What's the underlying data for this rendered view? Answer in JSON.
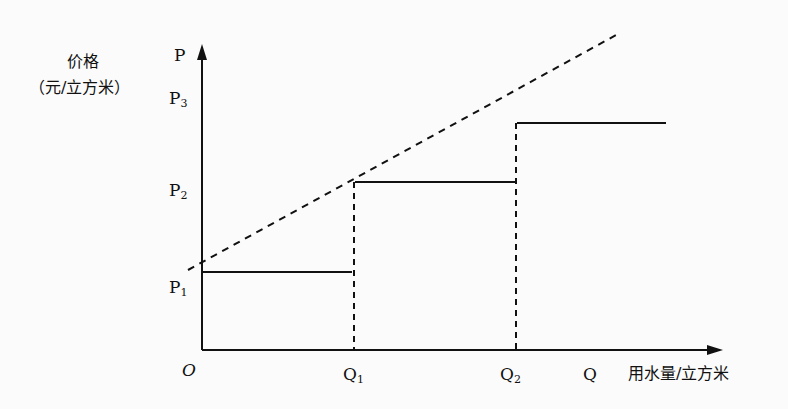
{
  "diagram": {
    "type": "tiered water pricing (stepped price vs. linear price)",
    "y_axis": {
      "symbol": "P",
      "title": "价格",
      "unit": "（元/立方米）"
    },
    "x_axis": {
      "symbol": "Q",
      "title": "用水量/立方米"
    },
    "origin": "O",
    "price_levels": {
      "p1": "P",
      "p1_sub": "1",
      "p2": "P",
      "p2_sub": "2",
      "p3": "P",
      "p3_sub": "3"
    },
    "quantity_levels": {
      "q1": "Q",
      "q1_sub": "1",
      "q2": "Q",
      "q2_sub": "2"
    },
    "segments": [
      {
        "from": "O",
        "to": "Q1",
        "price": "P1",
        "style": "solid"
      },
      {
        "from": "Q1",
        "to": "Q2",
        "price": "P2",
        "style": "solid"
      },
      {
        "from": "Q2",
        "to": "beyond",
        "price": "P3",
        "style": "solid"
      }
    ],
    "reference_line": {
      "style": "dashed",
      "description": "linear price line through the start of each tier"
    },
    "colors": {
      "ink": "#111111",
      "background": "#fbfbfb"
    }
  }
}
